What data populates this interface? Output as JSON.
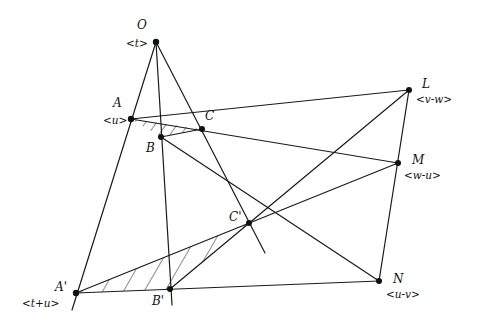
{
  "diagram": {
    "line_color": "#1a1a1a",
    "point_color": "#111111",
    "points": [
      {
        "id": "O",
        "label": "O",
        "coord": "<t>",
        "x": 156,
        "y": 42
      },
      {
        "id": "A",
        "label": "A",
        "coord": "<u>",
        "x": 131,
        "y": 119
      },
      {
        "id": "B",
        "label": "B",
        "coord": "",
        "x": 161,
        "y": 137
      },
      {
        "id": "C",
        "label": "C",
        "coord": "",
        "x": 202,
        "y": 129
      },
      {
        "id": "L",
        "label": "L",
        "coord": "<v-w>",
        "x": 409,
        "y": 90
      },
      {
        "id": "M",
        "label": "M",
        "coord": "<w-u>",
        "x": 398,
        "y": 163
      },
      {
        "id": "N",
        "label": "N",
        "coord": "<u-v>",
        "x": 379,
        "y": 281
      },
      {
        "id": "A'",
        "label": "A'",
        "coord": "<t+u>",
        "x": 76,
        "y": 293
      },
      {
        "id": "B'",
        "label": "B'",
        "coord": "",
        "x": 170,
        "y": 289
      },
      {
        "id": "C'",
        "label": "C'",
        "coord": "",
        "x": 249,
        "y": 223
      }
    ],
    "labels": {
      "O": "O",
      "O_coord": "<t>",
      "A": "A",
      "A_coord": "<u>",
      "B": "B",
      "C": "C",
      "L": "L",
      "L_coord": "<v-w>",
      "M": "M",
      "M_coord": "<w-u>",
      "N": "N",
      "N_coord": "<u-v>",
      "A1": "A'",
      "A1_coord": "<t+u>",
      "B1": "B'",
      "C1": "C'"
    },
    "shaded_triangles": [
      "ABC",
      "A'B'C'"
    ]
  }
}
